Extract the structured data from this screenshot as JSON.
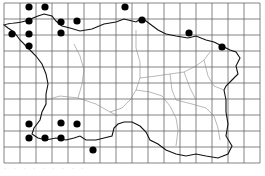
{
  "map": {
    "title": "Distribution map (grid squares)",
    "grid": {
      "x0": 4,
      "y0": 3,
      "cols": 16,
      "rows": 10,
      "cell": 16,
      "color": "#555555"
    },
    "coast_color": "#111111",
    "parish_color": "#888888",
    "dot_color": "#000000",
    "dots": [
      {
        "x": 29,
        "y": 7
      },
      {
        "x": 45,
        "y": 7
      },
      {
        "x": 125,
        "y": 7
      },
      {
        "x": 29,
        "y": 21
      },
      {
        "x": 61,
        "y": 22
      },
      {
        "x": 77,
        "y": 21
      },
      {
        "x": 12,
        "y": 34
      },
      {
        "x": 29,
        "y": 34
      },
      {
        "x": 61,
        "y": 33
      },
      {
        "x": 29,
        "y": 46
      },
      {
        "x": 142,
        "y": 20
      },
      {
        "x": 189,
        "y": 33
      },
      {
        "x": 222,
        "y": 47
      },
      {
        "x": 29,
        "y": 124
      },
      {
        "x": 61,
        "y": 123
      },
      {
        "x": 77,
        "y": 124
      },
      {
        "x": 29,
        "y": 138
      },
      {
        "x": 45,
        "y": 138
      },
      {
        "x": 61,
        "y": 138
      },
      {
        "x": 93,
        "y": 150
      }
    ]
  },
  "caption": "· ·  ·  ·  · · · ·  ·"
}
